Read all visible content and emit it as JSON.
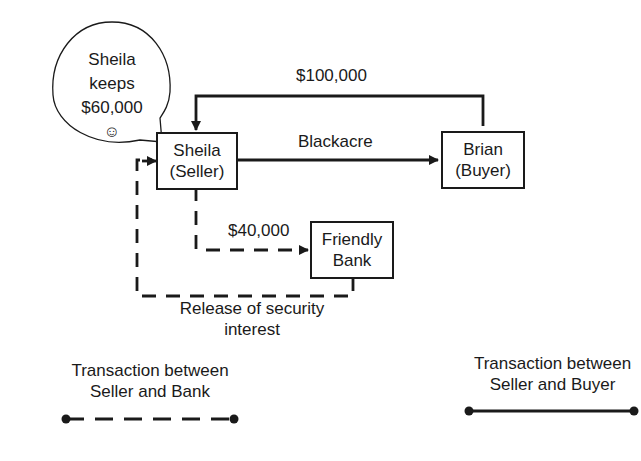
{
  "diagram": {
    "nodes": {
      "seller": {
        "line1": "Sheila",
        "line2": "(Seller)"
      },
      "buyer": {
        "line1": "Brian",
        "line2": "(Buyer)"
      },
      "bank": {
        "line1": "Friendly",
        "line2": "Bank"
      }
    },
    "speech_bubble": {
      "line1": "Sheila",
      "line2": "keeps",
      "line3": "$60,000",
      "emoji": "☺"
    },
    "edges": {
      "payment": {
        "label": "$100,000",
        "from": "Brian (Buyer)",
        "to": "Sheila (Seller)",
        "style": "solid"
      },
      "property": {
        "label": "Blackacre",
        "from": "Sheila (Seller)",
        "to": "Brian (Buyer)",
        "style": "solid"
      },
      "loan_payoff": {
        "label": "$40,000",
        "from": "Sheila (Seller)",
        "to": "Friendly Bank",
        "style": "dashed"
      },
      "release": {
        "label_line1": "Release of security",
        "label_line2": "interest",
        "from": "Friendly Bank",
        "to": "Sheila (Seller)",
        "style": "dashed"
      }
    },
    "legend": {
      "bank": {
        "line1": "Transaction between",
        "line2": "Seller and Bank",
        "style": "dashed"
      },
      "buyer": {
        "line1": "Transaction between",
        "line2": "Seller and Buyer",
        "style": "solid"
      }
    },
    "colors": {
      "line": "#1a1a1a",
      "background": "#ffffff"
    }
  }
}
